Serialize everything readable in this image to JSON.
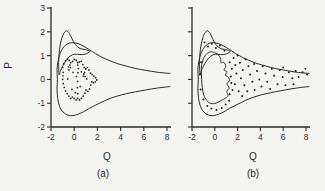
{
  "figure": {
    "background": "#f4f4f1",
    "ink_color": "#2b2b2b",
    "dot_color": "#1d1d1d"
  },
  "chart_data": [
    {
      "id": "a",
      "type": "scatter",
      "caption": "(a)",
      "xlabel": "Q",
      "ylabel": "P",
      "xlim": [
        -2,
        8
      ],
      "ylim": [
        -2,
        3
      ],
      "xticks": [
        -2,
        0,
        2,
        4,
        6,
        8
      ],
      "yticks": [
        -2,
        -1,
        0,
        1,
        2,
        3
      ],
      "show_ytick_labels": true,
      "grid": false,
      "legend": "none",
      "curves": {
        "outer_horn": [
          [
            8.3,
            0.25
          ],
          [
            7.2,
            0.3
          ],
          [
            6.2,
            0.38
          ],
          [
            5.3,
            0.46
          ],
          [
            4.5,
            0.56
          ],
          [
            3.7,
            0.67
          ],
          [
            3.0,
            0.8
          ],
          [
            2.4,
            0.93
          ],
          [
            1.85,
            1.08
          ],
          [
            1.3,
            1.25
          ],
          [
            0.8,
            1.4
          ],
          [
            0.35,
            1.5
          ],
          [
            -0.1,
            1.54
          ],
          [
            -0.45,
            1.52
          ],
          [
            -0.75,
            1.44
          ],
          [
            -1.02,
            1.28
          ],
          [
            -1.25,
            1.05
          ],
          [
            -1.4,
            0.75
          ],
          [
            -1.48,
            0.4
          ],
          [
            -1.45,
            0.0
          ],
          [
            -1.48,
            -0.4
          ],
          [
            -1.42,
            -0.8
          ],
          [
            -1.25,
            -1.15
          ],
          [
            -0.95,
            -1.38
          ],
          [
            -0.55,
            -1.5
          ],
          [
            -0.1,
            -1.52
          ],
          [
            0.35,
            -1.46
          ],
          [
            0.8,
            -1.36
          ],
          [
            1.3,
            -1.22
          ],
          [
            1.85,
            -1.08
          ],
          [
            2.4,
            -0.95
          ],
          [
            3.0,
            -0.82
          ],
          [
            3.7,
            -0.7
          ],
          [
            4.5,
            -0.6
          ],
          [
            5.3,
            -0.52
          ],
          [
            6.2,
            -0.44
          ],
          [
            7.2,
            -0.36
          ],
          [
            8.3,
            -0.3
          ]
        ],
        "spike_loop": [
          [
            -1.3,
            0.2
          ],
          [
            -1.34,
            0.8
          ],
          [
            -1.22,
            1.4
          ],
          [
            -0.98,
            1.85
          ],
          [
            -0.68,
            2.04
          ],
          [
            -0.42,
            1.94
          ],
          [
            -0.2,
            1.72
          ],
          [
            0.1,
            1.46
          ],
          [
            0.5,
            1.3
          ],
          [
            0.95,
            1.25
          ],
          [
            1.35,
            1.18
          ],
          [
            0.95,
            1.06
          ],
          [
            0.5,
            1.04
          ],
          [
            0.05,
            1.06
          ],
          [
            -0.35,
            0.98
          ],
          [
            -0.72,
            0.78
          ],
          [
            -1.0,
            0.55
          ],
          [
            -1.18,
            0.36
          ]
        ]
      },
      "points": [
        [
          -0.95,
          0.3
        ],
        [
          -1.0,
          0.5
        ],
        [
          -0.9,
          0.66
        ],
        [
          -0.75,
          0.78
        ],
        [
          -0.58,
          0.86
        ],
        [
          -0.42,
          0.8
        ],
        [
          -0.3,
          0.7
        ],
        [
          -0.14,
          0.76
        ],
        [
          0.02,
          0.84
        ],
        [
          0.18,
          0.8
        ],
        [
          0.3,
          0.7
        ],
        [
          0.44,
          0.74
        ],
        [
          0.6,
          0.76
        ],
        [
          0.74,
          0.62
        ],
        [
          0.86,
          0.5
        ],
        [
          1.0,
          0.44
        ],
        [
          1.14,
          0.5
        ],
        [
          1.28,
          0.4
        ],
        [
          1.4,
          0.26
        ],
        [
          1.54,
          0.2
        ],
        [
          1.7,
          0.14
        ],
        [
          1.85,
          0.07
        ],
        [
          1.95,
          -0.02
        ],
        [
          1.82,
          -0.1
        ],
        [
          1.66,
          -0.14
        ],
        [
          1.52,
          -0.1
        ],
        [
          1.42,
          -0.24
        ],
        [
          1.32,
          -0.4
        ],
        [
          1.16,
          -0.5
        ],
        [
          1.02,
          -0.44
        ],
        [
          0.92,
          -0.58
        ],
        [
          0.78,
          -0.7
        ],
        [
          0.62,
          -0.8
        ],
        [
          0.46,
          -0.86
        ],
        [
          0.3,
          -0.8
        ],
        [
          0.16,
          -0.86
        ],
        [
          0.0,
          -0.8
        ],
        [
          -0.16,
          -0.74
        ],
        [
          -0.3,
          -0.8
        ],
        [
          -0.46,
          -0.7
        ],
        [
          -0.6,
          -0.6
        ],
        [
          -0.74,
          -0.48
        ],
        [
          -0.86,
          -0.34
        ],
        [
          -0.94,
          -0.18
        ],
        [
          -1.0,
          0.0
        ],
        [
          -0.97,
          0.15
        ],
        [
          -0.5,
          0.52
        ],
        [
          -0.38,
          0.6
        ],
        [
          -0.46,
          0.4
        ],
        [
          -0.32,
          0.5
        ],
        [
          0.84,
          0.22
        ],
        [
          0.94,
          0.12
        ],
        [
          0.9,
          0.3
        ],
        [
          0.78,
          0.14
        ],
        [
          0.2,
          0.12
        ],
        [
          0.52,
          -0.3
        ],
        [
          -0.2,
          -0.42
        ],
        [
          0.1,
          -0.56
        ],
        [
          -0.56,
          0.02
        ],
        [
          0.62,
          0.32
        ],
        [
          1.08,
          0.02
        ],
        [
          0.36,
          0.46
        ],
        [
          -0.1,
          0.3
        ],
        [
          0.3,
          -0.08
        ],
        [
          0.3,
          0.6
        ],
        [
          0.32,
          0.28
        ],
        [
          0.28,
          -0.35
        ],
        [
          0.3,
          -0.6
        ]
      ]
    },
    {
      "id": "b",
      "type": "scatter",
      "caption": "(b)",
      "xlabel": "Q",
      "ylabel": "",
      "xlim": [
        -2,
        8
      ],
      "ylim": [
        -2,
        3
      ],
      "xticks": [
        -2,
        0,
        2,
        4,
        6,
        8
      ],
      "yticks": [
        -2,
        -1,
        0,
        1,
        2,
        3
      ],
      "show_ytick_labels": false,
      "grid": false,
      "legend": "none",
      "curves": {
        "outer_horn": [
          [
            8.3,
            0.25
          ],
          [
            7.2,
            0.3
          ],
          [
            6.2,
            0.38
          ],
          [
            5.3,
            0.46
          ],
          [
            4.5,
            0.56
          ],
          [
            3.7,
            0.67
          ],
          [
            3.0,
            0.8
          ],
          [
            2.4,
            0.93
          ],
          [
            1.85,
            1.08
          ],
          [
            1.3,
            1.25
          ],
          [
            0.8,
            1.4
          ],
          [
            0.35,
            1.5
          ],
          [
            -0.1,
            1.54
          ],
          [
            -0.45,
            1.52
          ],
          [
            -0.75,
            1.44
          ],
          [
            -1.02,
            1.28
          ],
          [
            -1.25,
            1.05
          ],
          [
            -1.4,
            0.75
          ],
          [
            -1.48,
            0.4
          ],
          [
            -1.45,
            0.0
          ],
          [
            -1.48,
            -0.4
          ],
          [
            -1.42,
            -0.8
          ],
          [
            -1.25,
            -1.15
          ],
          [
            -0.95,
            -1.38
          ],
          [
            -0.55,
            -1.5
          ],
          [
            -0.1,
            -1.52
          ],
          [
            0.35,
            -1.46
          ],
          [
            0.8,
            -1.36
          ],
          [
            1.3,
            -1.22
          ],
          [
            1.85,
            -1.08
          ],
          [
            2.4,
            -0.95
          ],
          [
            3.0,
            -0.82
          ],
          [
            3.7,
            -0.7
          ],
          [
            4.5,
            -0.6
          ],
          [
            5.3,
            -0.52
          ],
          [
            6.2,
            -0.44
          ],
          [
            7.2,
            -0.36
          ],
          [
            8.3,
            -0.3
          ]
        ],
        "spike_loop": [
          [
            -1.3,
            0.2
          ],
          [
            -1.34,
            0.8
          ],
          [
            -1.22,
            1.4
          ],
          [
            -0.98,
            1.85
          ],
          [
            -0.68,
            2.04
          ],
          [
            -0.42,
            1.94
          ],
          [
            -0.2,
            1.72
          ],
          [
            0.1,
            1.46
          ],
          [
            0.5,
            1.3
          ],
          [
            0.95,
            1.25
          ],
          [
            1.35,
            1.18
          ],
          [
            0.95,
            1.06
          ],
          [
            0.5,
            1.04
          ],
          [
            0.05,
            1.06
          ],
          [
            -0.35,
            0.98
          ],
          [
            -0.72,
            0.78
          ],
          [
            -1.0,
            0.55
          ],
          [
            -1.18,
            0.36
          ]
        ],
        "inner_blob": [
          [
            -1.15,
            0.0
          ],
          [
            -1.18,
            0.45
          ],
          [
            -1.05,
            0.8
          ],
          [
            -0.75,
            1.05
          ],
          [
            -0.4,
            1.16
          ],
          [
            -0.02,
            1.12
          ],
          [
            0.3,
            1.04
          ],
          [
            0.5,
            0.88
          ],
          [
            0.56,
            0.7
          ],
          [
            0.8,
            0.72
          ],
          [
            0.96,
            0.55
          ],
          [
            0.82,
            0.4
          ],
          [
            1.06,
            0.32
          ],
          [
            0.92,
            0.18
          ],
          [
            1.16,
            0.1
          ],
          [
            1.3,
            -0.05
          ],
          [
            1.05,
            -0.18
          ],
          [
            1.26,
            -0.36
          ],
          [
            1.05,
            -0.5
          ],
          [
            1.16,
            -0.68
          ],
          [
            0.9,
            -0.8
          ],
          [
            0.6,
            -0.88
          ],
          [
            0.28,
            -0.96
          ],
          [
            -0.05,
            -1.02
          ],
          [
            -0.4,
            -1.0
          ],
          [
            -0.72,
            -0.88
          ],
          [
            -0.97,
            -0.65
          ],
          [
            -1.1,
            -0.35
          ]
        ]
      },
      "points": [
        [
          -0.9,
          1.55
        ],
        [
          -0.6,
          1.38
        ],
        [
          -0.25,
          1.5
        ],
        [
          0.1,
          1.32
        ],
        [
          0.45,
          1.42
        ],
        [
          0.85,
          1.2
        ],
        [
          -1.2,
          0.72
        ],
        [
          -1.32,
          0.2
        ],
        [
          -1.25,
          -0.42
        ],
        [
          -1.0,
          -0.85
        ],
        [
          -0.65,
          -1.12
        ],
        [
          -0.3,
          -1.22
        ],
        [
          0.15,
          -1.28
        ],
        [
          0.6,
          -1.2
        ],
        [
          0.95,
          -1.05
        ],
        [
          1.25,
          -0.9
        ],
        [
          1.3,
          -0.62
        ],
        [
          1.55,
          -0.45
        ],
        [
          1.45,
          -0.15
        ],
        [
          1.4,
          0.12
        ],
        [
          1.5,
          0.45
        ],
        [
          1.3,
          0.72
        ],
        [
          1.65,
          0.9
        ],
        [
          2.0,
          1.0
        ],
        [
          1.8,
          0.6
        ],
        [
          1.9,
          0.25
        ],
        [
          1.75,
          -0.2
        ],
        [
          2.1,
          -0.5
        ],
        [
          2.4,
          -0.7
        ],
        [
          2.2,
          0.7
        ],
        [
          2.45,
          0.4
        ],
        [
          2.3,
          0.05
        ],
        [
          2.6,
          -0.25
        ],
        [
          2.85,
          -0.5
        ],
        [
          2.7,
          0.85
        ],
        [
          2.95,
          0.55
        ],
        [
          3.1,
          0.2
        ],
        [
          3.3,
          -0.1
        ],
        [
          3.5,
          -0.45
        ],
        [
          3.45,
          0.65
        ],
        [
          3.7,
          0.35
        ],
        [
          3.9,
          0.0
        ],
        [
          4.1,
          -0.3
        ],
        [
          4.2,
          0.55
        ],
        [
          4.45,
          0.25
        ],
        [
          4.6,
          -0.1
        ],
        [
          4.85,
          -0.4
        ],
        [
          5.0,
          0.45
        ],
        [
          5.2,
          0.15
        ],
        [
          5.5,
          -0.2
        ],
        [
          5.7,
          0.4
        ],
        [
          5.95,
          0.1
        ],
        [
          6.2,
          -0.25
        ],
        [
          6.5,
          0.3
        ],
        [
          6.8,
          0.05
        ],
        [
          7.1,
          0.35
        ],
        [
          7.35,
          0.1
        ],
        [
          7.7,
          0.3
        ],
        [
          7.95,
          0.45
        ],
        [
          8.1,
          0.2
        ],
        [
          6.0,
          0.5
        ],
        [
          6.9,
          -0.2
        ]
      ]
    }
  ]
}
